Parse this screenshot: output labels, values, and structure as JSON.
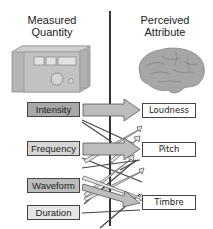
{
  "headers": {
    "left": [
      "Measured",
      "Quantity"
    ],
    "right": [
      "Perceived",
      "Attribute"
    ]
  },
  "illustrations": {
    "left": "measuring-device",
    "right": "brain"
  },
  "quantities": [
    {
      "label": "Intensity",
      "fill": "#a8a8a8"
    },
    {
      "label": "Frequency",
      "fill": "#d6d6d6"
    },
    {
      "label": "Waveform",
      "fill": "#bdbdbd"
    },
    {
      "label": "Duration",
      "fill": "#e6e6e6"
    }
  ],
  "attributes": [
    {
      "label": "Loudness"
    },
    {
      "label": "Pitch"
    },
    {
      "label": "Timbre"
    }
  ],
  "colors": {
    "arrow_fill": "#bdbdbd",
    "line": "#444444",
    "illustration": "#9a9a9a"
  }
}
